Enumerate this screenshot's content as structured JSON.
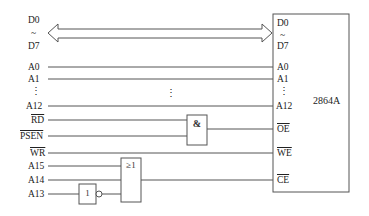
{
  "diagram": {
    "type": "memory-interface-circuit",
    "chip": {
      "name": "2864A",
      "pins": {
        "d0": "D0",
        "tilde": "~",
        "d7": "D7",
        "a0": "A0",
        "a1": "A1",
        "vdots": "⋮",
        "a12": "A12",
        "oe": "OE",
        "we": "WE",
        "ce": "CE"
      }
    },
    "left_signals": {
      "d0": "D0",
      "tilde": "~",
      "d7": "D7",
      "a0": "A0",
      "a1": "A1",
      "vdots": "⋮",
      "a12": "A12",
      "rd": "RD",
      "psen": "PSEN",
      "wr": "WR",
      "a15": "A15",
      "a14": "A14",
      "a13": "A13"
    },
    "middle_vdots": "⋮",
    "gates": {
      "and_gate": {
        "symbol": "&",
        "inputs": [
          "RD",
          "PSEN"
        ],
        "output": "OE"
      },
      "or_gate": {
        "symbol": "≥1",
        "inputs": [
          "A15",
          "A14",
          "NOT A13"
        ],
        "output": "CE"
      },
      "not_gate": {
        "symbol": "1",
        "input": "A13"
      }
    },
    "colors": {
      "line": "#555555",
      "text": "#222222",
      "background": "#ffffff"
    }
  }
}
